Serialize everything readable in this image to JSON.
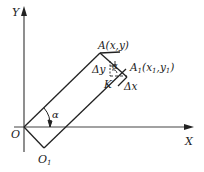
{
  "diagram": {
    "title": "",
    "axes": {
      "x_label": "X",
      "y_label": "Y",
      "origin_label": "O"
    },
    "points": {
      "O": {
        "label": "O"
      },
      "O1": {
        "label": "O",
        "sub": "1"
      },
      "A": {
        "label": "A(x,y)"
      },
      "A1": {
        "label_main": "A",
        "label_sub": "1",
        "label_rest": "(x",
        "label_sub2": "1",
        "label_mid": ",y",
        "label_sub3": "1",
        "label_end": ")"
      },
      "K": {
        "label": "K"
      }
    },
    "annotations": {
      "delta_y": "Δy",
      "delta_x": "Δx",
      "alpha_small": "α",
      "alpha_angle": "α"
    },
    "colors": {
      "line": "#222222",
      "axis": "#444444",
      "background": "#ffffff"
    }
  }
}
